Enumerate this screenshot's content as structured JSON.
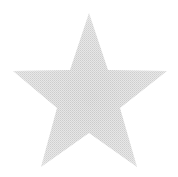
{
  "image": {
    "shape": "five-point-star",
    "fill_color": "#cfcfcf",
    "fill_light_color": "#e6e6e6",
    "background_color": "#ffffff",
    "fill_style": "halftone-dither"
  }
}
